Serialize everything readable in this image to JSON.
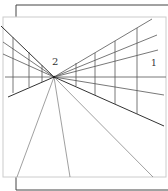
{
  "diagram": {
    "labels": {
      "vanishing_point": "2",
      "wall_region": "1"
    },
    "colors": {
      "line": "#555555",
      "frame": "#444444",
      "heavy_line": "#333333",
      "background": "#ffffff"
    },
    "elements": {
      "left_wall": {
        "horizontal_lines": 4,
        "vertical_lines": 3
      },
      "right_wall": {
        "horizontal_lines": 5,
        "vertical_lines": 4
      },
      "floor_lines": 3
    }
  }
}
